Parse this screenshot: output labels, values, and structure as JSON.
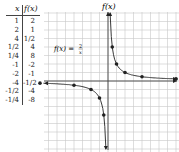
{
  "table": {
    "headers": [
      "x",
      "f(x)"
    ],
    "rows": [
      {
        "x": "1",
        "fx": "2"
      },
      {
        "x": "2",
        "fx": "1"
      },
      {
        "x": "4",
        "fx": "1/2"
      },
      {
        "x": "1/2",
        "fx": "4"
      },
      {
        "x": "1/4",
        "fx": "8"
      },
      {
        "x": "-1",
        "fx": "-2"
      },
      {
        "x": "-2",
        "fx": "-1"
      },
      {
        "x": "-4",
        "fx": "-1/2"
      },
      {
        "x": "-1/2",
        "fx": "-4"
      },
      {
        "x": "-1/4",
        "fx": "-8"
      }
    ]
  },
  "chart_data": {
    "type": "line",
    "title": "",
    "ylabel": "f(x)",
    "xlabel": "x",
    "annotation": "f(x) = 2/x",
    "grid": true,
    "series": [
      {
        "name": "f(x) = 2/x (x>0)",
        "x": [
          0.25,
          0.5,
          1,
          2,
          4
        ],
        "y": [
          8,
          4,
          2,
          1,
          0.5
        ]
      },
      {
        "name": "f(x) = 2/x (x<0)",
        "x": [
          -4,
          -2,
          -1,
          -0.5,
          -0.25
        ],
        "y": [
          -0.5,
          -1,
          -2,
          -4,
          -8
        ]
      }
    ]
  }
}
